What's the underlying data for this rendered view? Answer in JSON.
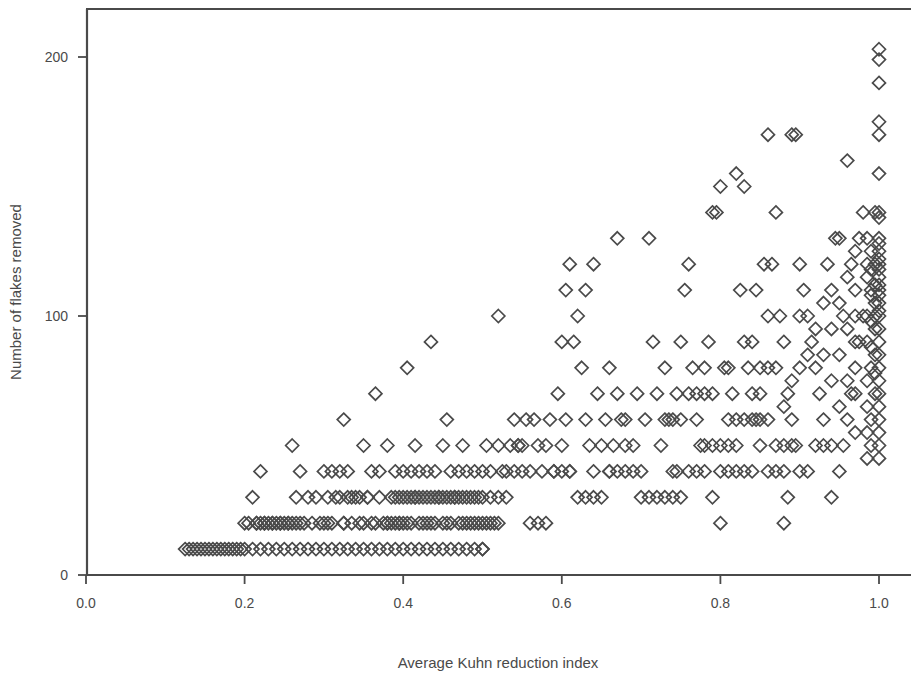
{
  "chart_data": {
    "type": "scatter",
    "title": "",
    "xlabel": "Average Kuhn reduction index",
    "ylabel": "Number of flakes removed",
    "xlim": [
      0.0,
      1.06
    ],
    "ylim": [
      0,
      215
    ],
    "xticks": [
      0.0,
      0.2,
      0.4,
      0.6,
      0.8,
      1.0
    ],
    "xticklabels": [
      "0.0",
      "0.2",
      "0.4",
      "0.6",
      "0.8",
      "1.0"
    ],
    "yticks": [
      0,
      100,
      200
    ],
    "yticklabels": [
      "0",
      "100",
      "200"
    ],
    "grid": false,
    "legend": null,
    "marker": "diamond-open",
    "marker_color": "#4a4a4a",
    "marker_size": 13,
    "frame": {
      "top": true,
      "left": true,
      "bottom": true,
      "right": false
    },
    "points": [
      [
        0.13,
        10
      ],
      [
        0.14,
        10
      ],
      [
        0.15,
        10
      ],
      [
        0.16,
        10
      ],
      [
        0.17,
        10
      ],
      [
        0.175,
        10
      ],
      [
        0.185,
        10
      ],
      [
        0.19,
        10
      ],
      [
        0.2,
        10
      ],
      [
        0.205,
        20
      ],
      [
        0.21,
        10
      ],
      [
        0.215,
        20
      ],
      [
        0.22,
        10
      ],
      [
        0.225,
        20
      ],
      [
        0.23,
        10
      ],
      [
        0.235,
        20
      ],
      [
        0.24,
        10
      ],
      [
        0.245,
        20
      ],
      [
        0.25,
        10
      ],
      [
        0.255,
        20
      ],
      [
        0.26,
        10
      ],
      [
        0.265,
        30
      ],
      [
        0.27,
        10
      ],
      [
        0.275,
        20
      ],
      [
        0.28,
        10
      ],
      [
        0.285,
        20
      ],
      [
        0.29,
        10
      ],
      [
        0.295,
        20
      ],
      [
        0.3,
        10
      ],
      [
        0.305,
        20
      ],
      [
        0.31,
        10
      ],
      [
        0.315,
        30
      ],
      [
        0.32,
        10
      ],
      [
        0.325,
        20
      ],
      [
        0.33,
        10
      ],
      [
        0.335,
        20
      ],
      [
        0.34,
        10
      ],
      [
        0.345,
        20
      ],
      [
        0.35,
        10
      ],
      [
        0.355,
        30
      ],
      [
        0.36,
        10
      ],
      [
        0.365,
        20
      ],
      [
        0.37,
        10
      ],
      [
        0.375,
        20
      ],
      [
        0.38,
        10
      ],
      [
        0.385,
        30
      ],
      [
        0.39,
        10
      ],
      [
        0.395,
        20
      ],
      [
        0.4,
        10
      ],
      [
        0.405,
        20
      ],
      [
        0.41,
        10
      ],
      [
        0.415,
        30
      ],
      [
        0.42,
        10
      ],
      [
        0.425,
        20
      ],
      [
        0.43,
        10
      ],
      [
        0.435,
        20
      ],
      [
        0.44,
        10
      ],
      [
        0.445,
        30
      ],
      [
        0.45,
        10
      ],
      [
        0.455,
        20
      ],
      [
        0.46,
        10
      ],
      [
        0.465,
        30
      ],
      [
        0.47,
        10
      ],
      [
        0.475,
        20
      ],
      [
        0.48,
        10
      ],
      [
        0.485,
        20
      ],
      [
        0.49,
        10
      ],
      [
        0.5,
        10
      ],
      [
        0.505,
        20
      ],
      [
        0.51,
        20
      ],
      [
        0.515,
        20
      ],
      [
        0.52,
        20
      ],
      [
        0.2,
        20
      ],
      [
        0.21,
        30
      ],
      [
        0.215,
        20
      ],
      [
        0.22,
        20
      ],
      [
        0.225,
        20
      ],
      [
        0.23,
        20
      ],
      [
        0.235,
        20
      ],
      [
        0.24,
        20
      ],
      [
        0.245,
        20
      ],
      [
        0.25,
        20
      ],
      [
        0.255,
        20
      ],
      [
        0.26,
        20
      ],
      [
        0.265,
        20
      ],
      [
        0.27,
        20
      ],
      [
        0.28,
        30
      ],
      [
        0.29,
        30
      ],
      [
        0.3,
        20
      ],
      [
        0.305,
        30
      ],
      [
        0.31,
        20
      ],
      [
        0.32,
        30
      ],
      [
        0.325,
        20
      ],
      [
        0.33,
        30
      ],
      [
        0.335,
        30
      ],
      [
        0.34,
        30
      ],
      [
        0.345,
        30
      ],
      [
        0.35,
        20
      ],
      [
        0.355,
        30
      ],
      [
        0.36,
        20
      ],
      [
        0.37,
        30
      ],
      [
        0.38,
        20
      ],
      [
        0.39,
        30
      ],
      [
        0.395,
        30
      ],
      [
        0.4,
        30
      ],
      [
        0.405,
        30
      ],
      [
        0.41,
        30
      ],
      [
        0.415,
        30
      ],
      [
        0.42,
        30
      ],
      [
        0.425,
        30
      ],
      [
        0.43,
        30
      ],
      [
        0.435,
        30
      ],
      [
        0.44,
        30
      ],
      [
        0.445,
        30
      ],
      [
        0.45,
        30
      ],
      [
        0.455,
        30
      ],
      [
        0.46,
        30
      ],
      [
        0.465,
        30
      ],
      [
        0.47,
        30
      ],
      [
        0.475,
        30
      ],
      [
        0.48,
        30
      ],
      [
        0.485,
        30
      ],
      [
        0.49,
        30
      ],
      [
        0.495,
        30
      ],
      [
        0.5,
        30
      ],
      [
        0.51,
        30
      ],
      [
        0.52,
        30
      ],
      [
        0.53,
        30
      ],
      [
        0.22,
        40
      ],
      [
        0.26,
        50
      ],
      [
        0.27,
        40
      ],
      [
        0.3,
        40
      ],
      [
        0.31,
        40
      ],
      [
        0.32,
        40
      ],
      [
        0.325,
        60
      ],
      [
        0.33,
        40
      ],
      [
        0.35,
        50
      ],
      [
        0.36,
        40
      ],
      [
        0.365,
        70
      ],
      [
        0.37,
        40
      ],
      [
        0.38,
        50
      ],
      [
        0.39,
        40
      ],
      [
        0.4,
        40
      ],
      [
        0.405,
        80
      ],
      [
        0.41,
        40
      ],
      [
        0.415,
        50
      ],
      [
        0.42,
        40
      ],
      [
        0.43,
        40
      ],
      [
        0.435,
        90
      ],
      [
        0.44,
        40
      ],
      [
        0.45,
        50
      ],
      [
        0.455,
        60
      ],
      [
        0.46,
        40
      ],
      [
        0.47,
        40
      ],
      [
        0.475,
        50
      ],
      [
        0.48,
        40
      ],
      [
        0.49,
        40
      ],
      [
        0.5,
        40
      ],
      [
        0.505,
        50
      ],
      [
        0.51,
        40
      ],
      [
        0.52,
        50
      ],
      [
        0.525,
        40
      ],
      [
        0.53,
        40
      ],
      [
        0.535,
        50
      ],
      [
        0.54,
        40
      ],
      [
        0.545,
        50
      ],
      [
        0.55,
        40
      ],
      [
        0.555,
        60
      ],
      [
        0.52,
        100
      ],
      [
        0.54,
        60
      ],
      [
        0.545,
        50
      ],
      [
        0.55,
        50
      ],
      [
        0.56,
        40
      ],
      [
        0.565,
        60
      ],
      [
        0.57,
        50
      ],
      [
        0.575,
        40
      ],
      [
        0.58,
        50
      ],
      [
        0.585,
        60
      ],
      [
        0.59,
        40
      ],
      [
        0.595,
        70
      ],
      [
        0.6,
        50
      ],
      [
        0.605,
        60
      ],
      [
        0.61,
        40
      ],
      [
        0.615,
        90
      ],
      [
        0.6,
        90
      ],
      [
        0.605,
        110
      ],
      [
        0.61,
        120
      ],
      [
        0.62,
        100
      ],
      [
        0.625,
        80
      ],
      [
        0.63,
        60
      ],
      [
        0.635,
        50
      ],
      [
        0.64,
        40
      ],
      [
        0.645,
        70
      ],
      [
        0.65,
        50
      ],
      [
        0.655,
        60
      ],
      [
        0.66,
        40
      ],
      [
        0.665,
        50
      ],
      [
        0.67,
        70
      ],
      [
        0.675,
        60
      ],
      [
        0.68,
        50
      ],
      [
        0.63,
        110
      ],
      [
        0.64,
        120
      ],
      [
        0.66,
        80
      ],
      [
        0.67,
        130
      ],
      [
        0.68,
        60
      ],
      [
        0.69,
        50
      ],
      [
        0.695,
        70
      ],
      [
        0.7,
        40
      ],
      [
        0.705,
        60
      ],
      [
        0.71,
        130
      ],
      [
        0.715,
        90
      ],
      [
        0.72,
        70
      ],
      [
        0.725,
        50
      ],
      [
        0.73,
        80
      ],
      [
        0.735,
        60
      ],
      [
        0.74,
        40
      ],
      [
        0.745,
        70
      ],
      [
        0.75,
        90
      ],
      [
        0.755,
        110
      ],
      [
        0.76,
        120
      ],
      [
        0.765,
        80
      ],
      [
        0.77,
        60
      ],
      [
        0.775,
        50
      ],
      [
        0.78,
        70
      ],
      [
        0.785,
        90
      ],
      [
        0.79,
        140
      ],
      [
        0.795,
        140
      ],
      [
        0.8,
        150
      ],
      [
        0.805,
        80
      ],
      [
        0.81,
        60
      ],
      [
        0.815,
        70
      ],
      [
        0.82,
        50
      ],
      [
        0.825,
        110
      ],
      [
        0.83,
        90
      ],
      [
        0.835,
        80
      ],
      [
        0.84,
        70
      ],
      [
        0.845,
        60
      ],
      [
        0.85,
        50
      ],
      [
        0.855,
        120
      ],
      [
        0.86,
        100
      ],
      [
        0.79,
        30
      ],
      [
        0.8,
        20
      ],
      [
        0.81,
        80
      ],
      [
        0.82,
        155
      ],
      [
        0.83,
        150
      ],
      [
        0.84,
        90
      ],
      [
        0.845,
        110
      ],
      [
        0.85,
        80
      ],
      [
        0.86,
        170
      ],
      [
        0.865,
        120
      ],
      [
        0.87,
        140
      ],
      [
        0.875,
        100
      ],
      [
        0.88,
        90
      ],
      [
        0.885,
        70
      ],
      [
        0.89,
        60
      ],
      [
        0.895,
        50
      ],
      [
        0.88,
        20
      ],
      [
        0.885,
        30
      ],
      [
        0.89,
        170
      ],
      [
        0.895,
        170
      ],
      [
        0.9,
        120
      ],
      [
        0.905,
        110
      ],
      [
        0.91,
        100
      ],
      [
        0.915,
        90
      ],
      [
        0.92,
        80
      ],
      [
        0.925,
        70
      ],
      [
        0.93,
        60
      ],
      [
        0.935,
        120
      ],
      [
        0.94,
        110
      ],
      [
        0.945,
        130
      ],
      [
        0.95,
        130
      ],
      [
        0.955,
        100
      ],
      [
        0.94,
        30
      ],
      [
        0.95,
        40
      ],
      [
        0.955,
        50
      ],
      [
        0.96,
        60
      ],
      [
        0.965,
        70
      ],
      [
        0.97,
        80
      ],
      [
        0.975,
        90
      ],
      [
        0.98,
        100
      ],
      [
        0.96,
        160
      ],
      [
        0.965,
        120
      ],
      [
        0.97,
        110
      ],
      [
        0.975,
        130
      ],
      [
        0.98,
        140
      ],
      [
        0.985,
        120
      ],
      [
        0.99,
        110
      ],
      [
        0.995,
        100
      ],
      [
        1.0,
        203
      ],
      [
        1.0,
        199
      ],
      [
        1.0,
        190
      ],
      [
        1.0,
        175
      ],
      [
        1.0,
        170
      ],
      [
        1.0,
        155
      ],
      [
        1.0,
        140
      ],
      [
        1.0,
        138
      ],
      [
        1.0,
        130
      ],
      [
        1.0,
        128
      ],
      [
        1.0,
        125
      ],
      [
        1.0,
        122
      ],
      [
        1.0,
        120
      ],
      [
        1.0,
        118
      ],
      [
        1.0,
        115
      ],
      [
        1.0,
        112
      ],
      [
        1.0,
        110
      ],
      [
        1.0,
        108
      ],
      [
        1.0,
        105
      ],
      [
        1.0,
        102
      ],
      [
        1.0,
        100
      ],
      [
        1.0,
        95
      ],
      [
        1.0,
        90
      ],
      [
        1.0,
        85
      ],
      [
        1.0,
        80
      ],
      [
        1.0,
        75
      ],
      [
        1.0,
        70
      ],
      [
        1.0,
        65
      ],
      [
        1.0,
        60
      ],
      [
        1.0,
        55
      ],
      [
        1.0,
        50
      ],
      [
        1.0,
        45
      ],
      [
        0.995,
        140
      ],
      [
        0.995,
        120
      ],
      [
        0.995,
        112
      ],
      [
        0.995,
        105
      ],
      [
        0.995,
        95
      ],
      [
        0.995,
        85
      ],
      [
        0.995,
        78
      ],
      [
        0.995,
        70
      ],
      [
        0.99,
        125
      ],
      [
        0.99,
        118
      ],
      [
        0.99,
        108
      ],
      [
        0.99,
        98
      ],
      [
        0.99,
        88
      ],
      [
        0.99,
        80
      ],
      [
        0.99,
        60
      ],
      [
        0.99,
        50
      ],
      [
        0.985,
        130
      ],
      [
        0.985,
        115
      ],
      [
        0.985,
        100
      ],
      [
        0.985,
        90
      ],
      [
        0.985,
        75
      ],
      [
        0.985,
        65
      ],
      [
        0.985,
        55
      ],
      [
        0.985,
        45
      ],
      [
        0.97,
        125
      ],
      [
        0.97,
        100
      ],
      [
        0.97,
        90
      ],
      [
        0.97,
        70
      ],
      [
        0.97,
        55
      ],
      [
        0.96,
        115
      ],
      [
        0.96,
        95
      ],
      [
        0.96,
        75
      ],
      [
        0.95,
        105
      ],
      [
        0.95,
        85
      ],
      [
        0.95,
        65
      ],
      [
        0.94,
        95
      ],
      [
        0.94,
        75
      ],
      [
        0.93,
        85
      ],
      [
        0.93,
        105
      ],
      [
        0.92,
        95
      ],
      [
        0.91,
        85
      ],
      [
        0.9,
        80
      ],
      [
        0.9,
        100
      ],
      [
        0.89,
        75
      ],
      [
        0.88,
        65
      ],
      [
        0.87,
        80
      ],
      [
        0.86,
        60
      ],
      [
        0.85,
        70
      ],
      [
        0.45,
        20
      ],
      [
        0.46,
        20
      ],
      [
        0.47,
        20
      ],
      [
        0.48,
        20
      ],
      [
        0.49,
        20
      ],
      [
        0.495,
        20
      ],
      [
        0.5,
        20
      ],
      [
        0.42,
        20
      ],
      [
        0.43,
        20
      ],
      [
        0.44,
        20
      ],
      [
        0.41,
        20
      ],
      [
        0.4,
        20
      ],
      [
        0.395,
        20
      ],
      [
        0.39,
        20
      ],
      [
        0.385,
        20
      ],
      [
        0.38,
        20
      ],
      [
        0.56,
        20
      ],
      [
        0.57,
        20
      ],
      [
        0.58,
        20
      ],
      [
        0.62,
        30
      ],
      [
        0.63,
        30
      ],
      [
        0.64,
        30
      ],
      [
        0.65,
        30
      ],
      [
        0.7,
        30
      ],
      [
        0.71,
        30
      ],
      [
        0.72,
        30
      ],
      [
        0.73,
        30
      ],
      [
        0.74,
        30
      ],
      [
        0.75,
        30
      ],
      [
        0.76,
        40
      ],
      [
        0.77,
        40
      ],
      [
        0.78,
        40
      ],
      [
        0.59,
        40
      ],
      [
        0.6,
        40
      ],
      [
        0.61,
        40
      ],
      [
        0.66,
        40
      ],
      [
        0.67,
        40
      ],
      [
        0.68,
        40
      ],
      [
        0.69,
        40
      ],
      [
        0.745,
        40
      ],
      [
        0.8,
        40
      ],
      [
        0.81,
        40
      ],
      [
        0.82,
        40
      ],
      [
        0.83,
        40
      ],
      [
        0.84,
        40
      ],
      [
        0.86,
        40
      ],
      [
        0.87,
        40
      ],
      [
        0.88,
        40
      ],
      [
        0.9,
        40
      ],
      [
        0.91,
        40
      ],
      [
        0.92,
        50
      ],
      [
        0.93,
        50
      ],
      [
        0.94,
        50
      ],
      [
        0.87,
        50
      ],
      [
        0.88,
        50
      ],
      [
        0.89,
        50
      ],
      [
        0.78,
        50
      ],
      [
        0.79,
        50
      ],
      [
        0.8,
        50
      ],
      [
        0.81,
        50
      ],
      [
        0.82,
        60
      ],
      [
        0.83,
        60
      ],
      [
        0.84,
        60
      ],
      [
        0.85,
        60
      ],
      [
        0.73,
        60
      ],
      [
        0.74,
        60
      ],
      [
        0.75,
        60
      ],
      [
        0.76,
        70
      ],
      [
        0.77,
        70
      ],
      [
        0.78,
        80
      ],
      [
        0.79,
        70
      ],
      [
        0.86,
        80
      ],
      [
        0.155,
        10
      ],
      [
        0.165,
        10
      ],
      [
        0.18,
        10
      ],
      [
        0.195,
        10
      ],
      [
        0.125,
        10
      ],
      [
        0.135,
        10
      ],
      [
        0.145,
        10
      ],
      [
        0.5,
        10
      ]
    ]
  },
  "axes": {
    "y_label": "Number of flakes removed",
    "x_label": "Average Kuhn reduction index"
  }
}
